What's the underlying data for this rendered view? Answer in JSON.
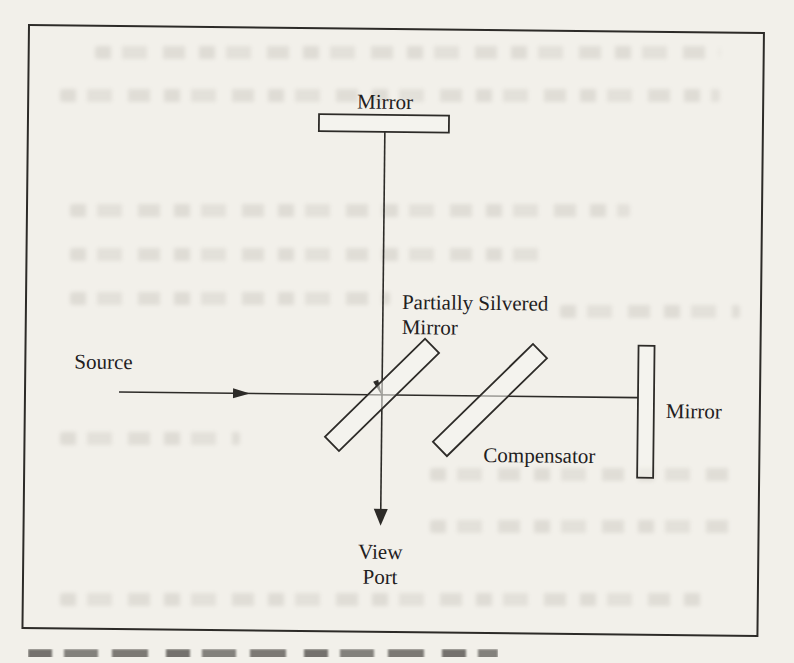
{
  "figure": {
    "labels": {
      "top_mirror": "Mirror",
      "partially_silvered_line1": "Partially Silvered",
      "partially_silvered_line2": "Mirror",
      "source": "Source",
      "compensator": "Compensator",
      "right_mirror": "Mirror",
      "view_port_line1": "View",
      "view_port_line2": "Port"
    },
    "colors": {
      "paper": "#f2f0ea",
      "ink": "#2d2b28",
      "text": "#22201d",
      "bleedthrough": "#7d776c"
    }
  }
}
